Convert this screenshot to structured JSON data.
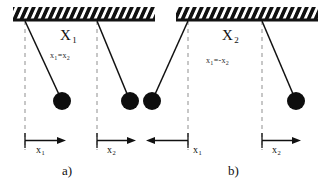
{
  "figure": {
    "type": "physics-diagram",
    "background_color": "#ffffff",
    "ink_color": "#111111",
    "bob_color": "#0d0d0d",
    "dashed_color": "#9a9a9a"
  },
  "panels": [
    {
      "id": "a",
      "caption": "a)",
      "mode_label": "X",
      "mode_subscript": "1",
      "relation_lhs": "x",
      "relation_lhs_sub": "1",
      "relation_op": "=",
      "relation_rhs": "x",
      "relation_rhs_sub": "2",
      "relation_text": "x₁=x₂",
      "ceiling_hatched": true,
      "pendulums": [
        {
          "name": "pendulum-1",
          "pivot_x": 25,
          "pivot_y": 21,
          "bob_x": 62,
          "bob_y": 101,
          "bob_r": 9,
          "equilibrium_x": 25,
          "direction": "right"
        },
        {
          "name": "pendulum-2",
          "pivot_x": 97,
          "pivot_y": 21,
          "bob_x": 130,
          "bob_y": 101,
          "bob_r": 9,
          "equilibrium_x": 97,
          "direction": "right"
        }
      ],
      "measures": [
        {
          "name": "displacement-x1",
          "label": "x",
          "sublabel": "1",
          "arrow_direction": "right",
          "from_x": 25,
          "to_x": 62,
          "y": 142
        },
        {
          "name": "displacement-x2",
          "label": "x",
          "sublabel": "2",
          "arrow_direction": "right",
          "from_x": 97,
          "to_x": 133,
          "y": 142
        }
      ]
    },
    {
      "id": "b",
      "caption": "b)",
      "mode_label": "X",
      "mode_subscript": "2",
      "relation_lhs": "x",
      "relation_lhs_sub": "1",
      "relation_op": "=-",
      "relation_rhs": "x",
      "relation_rhs_sub": "2",
      "relation_text": "x₁=-x₂",
      "ceiling_hatched": true,
      "pendulums": [
        {
          "name": "pendulum-1",
          "pivot_x": 188,
          "pivot_y": 21,
          "bob_x": 152,
          "bob_y": 101,
          "bob_r": 9,
          "equilibrium_x": 188,
          "direction": "left"
        },
        {
          "name": "pendulum-2",
          "pivot_x": 262,
          "pivot_y": 21,
          "bob_x": 296,
          "bob_y": 101,
          "bob_r": 9,
          "equilibrium_x": 262,
          "direction": "right"
        }
      ],
      "measures": [
        {
          "name": "displacement-x1",
          "label": "x",
          "sublabel": "1",
          "arrow_direction": "left",
          "from_x": 188,
          "to_x": 150,
          "y": 142
        },
        {
          "name": "displacement-x2",
          "label": "x",
          "sublabel": "2",
          "arrow_direction": "right",
          "from_x": 262,
          "to_x": 298,
          "y": 142
        }
      ]
    }
  ],
  "ceilings": [
    {
      "name": "ceiling-a",
      "x1": 13,
      "x2": 155,
      "y": 21
    },
    {
      "name": "ceiling-b",
      "x1": 176,
      "x2": 318,
      "y": 21
    }
  ],
  "labels": {
    "mode_a": "X",
    "mode_a_sub": "1",
    "mode_b": "X",
    "mode_b_sub": "2",
    "relation_a_lhs": "x",
    "relation_a_lhs_sub": "1",
    "relation_a_mid": "=",
    "relation_a_rhs": "x",
    "relation_a_rhs_sub": "2",
    "relation_b_lhs": "x",
    "relation_b_lhs_sub": "1",
    "relation_b_mid": "=-",
    "relation_b_rhs": "x",
    "relation_b_rhs_sub": "2",
    "caption_a": "a)",
    "caption_b": "b)",
    "axis_a1": "x",
    "axis_a1_sub": "1",
    "axis_a2": "x",
    "axis_a2_sub": "2",
    "axis_b1": "x",
    "axis_b1_sub": "1",
    "axis_b2": "x",
    "axis_b2_sub": "2"
  }
}
